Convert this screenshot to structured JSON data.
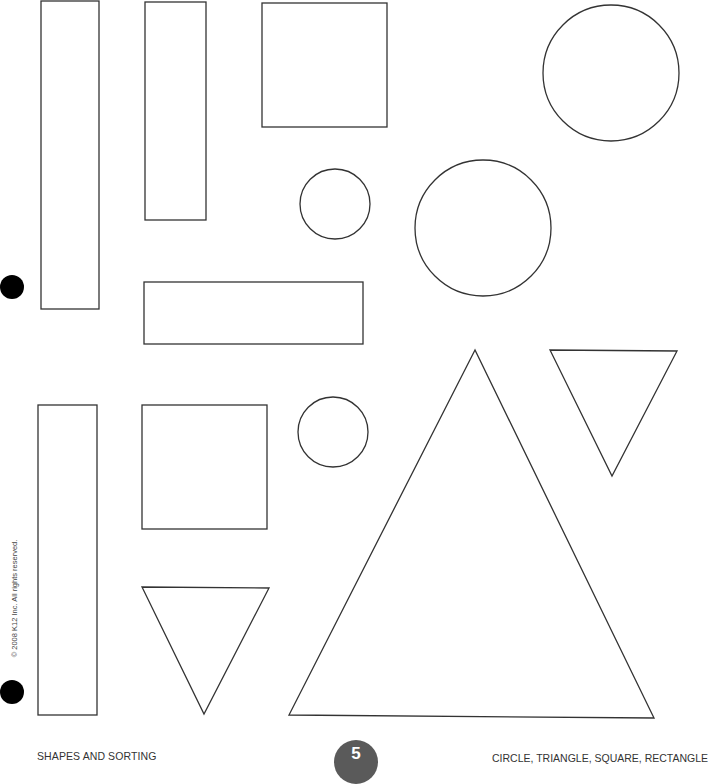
{
  "page": {
    "footer_left": "SHAPES AND SORTING",
    "footer_right": "CIRCLE, TRIANGLE, SQUARE, RECTANGLE",
    "page_number": "5",
    "copyright": "© 2008 K12 Inc. All rights reserved."
  },
  "style": {
    "stroke_color": "#333333",
    "page_number_bg": "#5a5a5a",
    "hole_color": "#000000"
  },
  "shapes": {
    "rectangles": [
      {
        "name": "tall-rectangle-top-left",
        "x": 41,
        "y": 1,
        "w": 58,
        "h": 308
      },
      {
        "name": "rectangle-top-middle",
        "x": 145,
        "y": 2,
        "w": 61,
        "h": 218
      },
      {
        "name": "wide-rectangle",
        "x": 144,
        "y": 282,
        "w": 219,
        "h": 62
      },
      {
        "name": "tall-rectangle-bottom-left",
        "x": 38,
        "y": 405,
        "w": 59,
        "h": 310
      }
    ],
    "squares": [
      {
        "name": "square-top",
        "x": 262,
        "y": 3,
        "w": 125,
        "h": 124
      },
      {
        "name": "square-bottom",
        "x": 142,
        "y": 405,
        "w": 125,
        "h": 124
      }
    ],
    "circles": [
      {
        "name": "circle-large-top-right",
        "cx": 611,
        "cy": 73,
        "r": 68
      },
      {
        "name": "circle-large-middle",
        "cx": 483,
        "cy": 228,
        "r": 68
      },
      {
        "name": "circle-small-top",
        "cx": 335,
        "cy": 204,
        "r": 35
      },
      {
        "name": "circle-small-bottom",
        "cx": 333,
        "cy": 432,
        "r": 35
      }
    ],
    "triangles": [
      {
        "name": "triangle-large",
        "points": "475,350 289,715 654,718"
      },
      {
        "name": "triangle-inverted-right",
        "points": "550,350 677,351 612,476"
      },
      {
        "name": "triangle-inverted-bottom",
        "points": "142,587 269,588 204,714"
      }
    ]
  },
  "holes": [
    {
      "x": 0,
      "y": 275
    },
    {
      "x": 0,
      "y": 680
    }
  ]
}
